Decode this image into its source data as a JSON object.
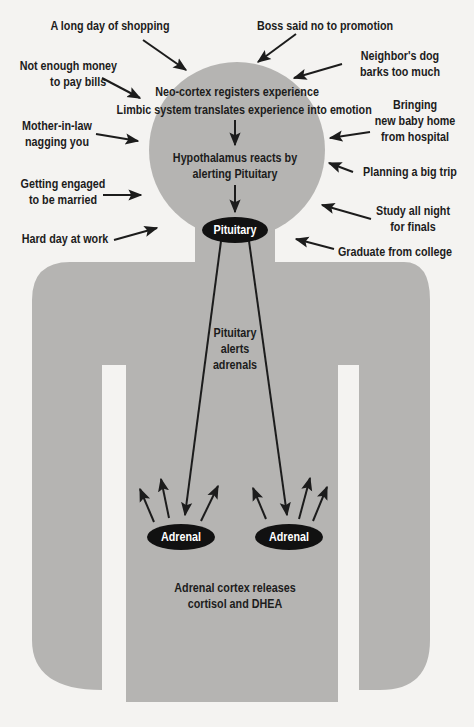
{
  "colors": {
    "background": "#f4f3f1",
    "body_fill": "#b5b4b2",
    "arrow": "#1c1c1c",
    "gland_fill": "#111111",
    "gland_text": "#ffffff"
  },
  "stressors": [
    {
      "id": "shopping",
      "lines": [
        "A long day of shopping"
      ]
    },
    {
      "id": "promotion",
      "lines": [
        "Boss said no to promotion"
      ]
    },
    {
      "id": "bills",
      "lines": [
        "Not enough money",
        "to pay bills"
      ]
    },
    {
      "id": "dog",
      "lines": [
        "Neighbor's dog",
        "barks too much"
      ]
    },
    {
      "id": "baby",
      "lines": [
        "Bringing",
        "new baby home",
        "from hospital"
      ]
    },
    {
      "id": "mother-in-law",
      "lines": [
        "Mother-in-law",
        "nagging you"
      ]
    },
    {
      "id": "trip",
      "lines": [
        "Planning a big trip"
      ]
    },
    {
      "id": "engaged",
      "lines": [
        "Getting engaged",
        "to be married"
      ]
    },
    {
      "id": "finals",
      "lines": [
        "Study all night",
        "for finals"
      ]
    },
    {
      "id": "work",
      "lines": [
        "Hard day at work"
      ]
    },
    {
      "id": "graduate",
      "lines": [
        "Graduate from college"
      ]
    }
  ],
  "head": {
    "line1": "Neo-cortex registers experience",
    "line2": "Limbic system translates experience into emotion",
    "hypothalamus_line1": "Hypothalamus reacts by",
    "hypothalamus_line2": "alerting Pituitary"
  },
  "pituitary_label": "Pituitary",
  "pituitary_alert": [
    "Pituitary",
    "alerts",
    "adrenals"
  ],
  "adrenals": [
    {
      "id": "left",
      "label": "Adrenal"
    },
    {
      "id": "right",
      "label": "Adrenal"
    }
  ],
  "release": {
    "line1": "Adrenal cortex releases",
    "line2": "cortisol and DHEA"
  }
}
